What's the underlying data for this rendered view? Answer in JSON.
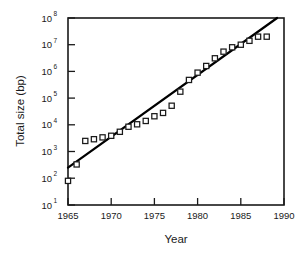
{
  "chart_data": {
    "type": "scatter",
    "title": "",
    "xlabel": "Year",
    "ylabel": "Total size (bp)",
    "xlim": [
      1965,
      1990
    ],
    "ylim": [
      10,
      100000000
    ],
    "yscale": "log",
    "xscale": "linear",
    "grid": false,
    "legend": null,
    "xticks": [
      1965,
      1970,
      1975,
      1980,
      1985,
      1990
    ],
    "xticklabels": [
      "1965",
      "1970",
      "1975",
      "1980",
      "1985",
      "1990"
    ],
    "yticks": [
      10,
      100,
      1000,
      10000,
      100000,
      1000000,
      10000000,
      100000000
    ],
    "yticklabels": [
      "10 1",
      "10 2",
      "10 3",
      "10 4",
      "10 5",
      "10 6",
      "10 7",
      "10 8"
    ],
    "ytick_mantissa": [
      "10",
      "10",
      "10",
      "10",
      "10",
      "10",
      "10",
      "10"
    ],
    "ytick_exponents": [
      "1",
      "2",
      "3",
      "4",
      "5",
      "6",
      "7",
      "8"
    ],
    "series": [
      {
        "name": "Total size (bp)",
        "marker": "open-square",
        "x": [
          1965,
          1966,
          1967,
          1968,
          1969,
          1970,
          1971,
          1972,
          1973,
          1974,
          1975,
          1976,
          1977,
          1978,
          1979,
          1980,
          1981,
          1982,
          1983,
          1984,
          1985,
          1986,
          1987,
          1988
        ],
        "y": [
          80,
          330,
          2500,
          2900,
          3400,
          3900,
          5500,
          8500,
          10500,
          14000,
          21000,
          28000,
          52000,
          175000,
          480000,
          900000,
          1600000,
          3100000,
          5500000,
          8000000,
          10000000,
          14000000,
          20000000,
          20000000
        ]
      }
    ],
    "fit_line": {
      "name": "exponential fit",
      "x": [
        1965,
        1989.2
      ],
      "y": [
        250,
        100000000
      ]
    }
  },
  "axes": {
    "x_title": "Year",
    "y_title": "Total size (bp)"
  }
}
